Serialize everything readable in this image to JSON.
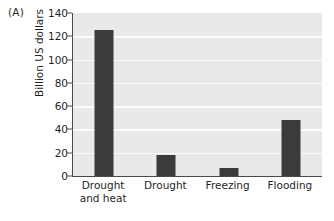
{
  "panel": {
    "label": "(A)"
  },
  "colors": {
    "bar": "#3b3b3b",
    "plot_background": "#e9e9e9",
    "gridline": "#fbfbfb",
    "axis": "#4a4a4a",
    "page_background": "#ffffff",
    "text": "#1f1f1f"
  },
  "chart_data": {
    "type": "bar",
    "title": "",
    "subtitle": "",
    "panel_label": "(A)",
    "xlabel": "",
    "ylabel": "Billion US dollars",
    "categories": [
      "Drought and heat",
      "Drought",
      "Freezing",
      "Flooding"
    ],
    "category_lines": [
      [
        "Drought",
        "and heat"
      ],
      [
        "Drought"
      ],
      [
        "Freezing"
      ],
      [
        "Flooding"
      ]
    ],
    "values": [
      125,
      18,
      7,
      48
    ],
    "ylim": [
      0,
      140
    ],
    "yticks": [
      0,
      20,
      40,
      60,
      80,
      100,
      120,
      140
    ],
    "ytick_labels": [
      "0",
      "20",
      "40",
      "60",
      "80",
      "100",
      "120",
      "140"
    ],
    "grid": true,
    "grid_axis": "y",
    "legend": false,
    "legend_position": "none",
    "series": [
      {
        "name": "Losses",
        "values": [
          125,
          18,
          7,
          48
        ]
      }
    ]
  }
}
